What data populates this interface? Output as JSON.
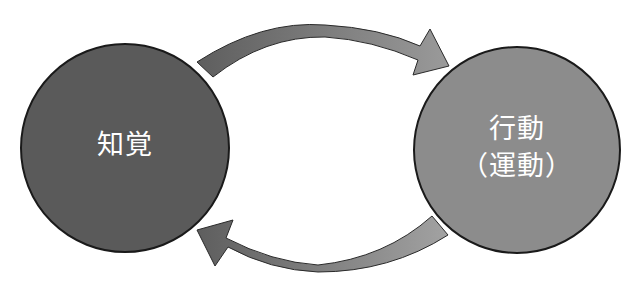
{
  "diagram": {
    "type": "cycle",
    "nodes": [
      {
        "id": "perception",
        "label": "知覚",
        "fill": "#5a5a5a",
        "center": [
          125,
          148
        ],
        "radius": 105
      },
      {
        "id": "action",
        "label": "行動",
        "sublabel": "（運動）",
        "fill": "#8c8c8c",
        "center": [
          517,
          150
        ],
        "radius": 104
      }
    ],
    "edges": [
      {
        "from": "perception",
        "to": "action",
        "position": "top",
        "gradient": [
          "#5e5e5e",
          "#9a9a9a"
        ]
      },
      {
        "from": "action",
        "to": "perception",
        "position": "bottom",
        "gradient": [
          "#5e5e5e",
          "#a0a0a0"
        ]
      }
    ],
    "colors": {
      "background": "#ffffff",
      "outline": "#1a1a1a",
      "label_text": "#ffffff"
    }
  }
}
